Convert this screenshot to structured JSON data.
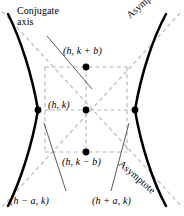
{
  "figure": {
    "type": "hyperbola-diagram",
    "width": 184,
    "height": 216,
    "background_color": "#ffffff",
    "curve_color": "#000000",
    "dashed_color": "#b0b0b0",
    "leader_color": "#5a5a5a",
    "point_color": "#000000"
  },
  "labels": {
    "conjugate_axis": "Conjugate axis",
    "asymptote_upper": "Asymptote",
    "asymptote_lower": "Asymptote",
    "top_point": "(h, k + b)",
    "center_point": "(h, k)",
    "bottom_point": "(h, k − b)",
    "left_vertex": "(h − a, k)",
    "right_vertex": "(h + a, k)"
  },
  "points": [
    {
      "name": "co-vertex-top",
      "label": "(h, k + b)",
      "x": 86,
      "y": 67
    },
    {
      "name": "center",
      "label": "(h, k)",
      "x": 86,
      "y": 110
    },
    {
      "name": "co-vertex-bottom",
      "label": "(h, k − b)",
      "x": 86,
      "y": 152
    },
    {
      "name": "vertex-left",
      "label": "(h − a, k)",
      "x": 38,
      "y": 110
    },
    {
      "name": "vertex-right",
      "label": "(h + a, k)",
      "x": 135,
      "y": 110
    }
  ],
  "reference_rectangle": {
    "left": 45,
    "top": 67,
    "right": 127,
    "bottom": 152
  },
  "asymptotes": [
    {
      "name": "asymptote-positive-slope",
      "from": [
        4,
        206
      ],
      "to": [
        180,
        10
      ]
    },
    {
      "name": "asymptote-negative-slope",
      "from": [
        4,
        12
      ],
      "to": [
        180,
        206
      ]
    }
  ],
  "leader_lines": [
    {
      "name": "leader-conjugate-axis",
      "from": [
        47,
        36
      ],
      "to": [
        92,
        89
      ]
    },
    {
      "name": "leader-left-vertex",
      "from": [
        66,
        192
      ],
      "to": [
        44,
        124
      ]
    },
    {
      "name": "leader-right-vertex",
      "from": [
        111,
        192
      ],
      "to": [
        128,
        124
      ]
    }
  ]
}
